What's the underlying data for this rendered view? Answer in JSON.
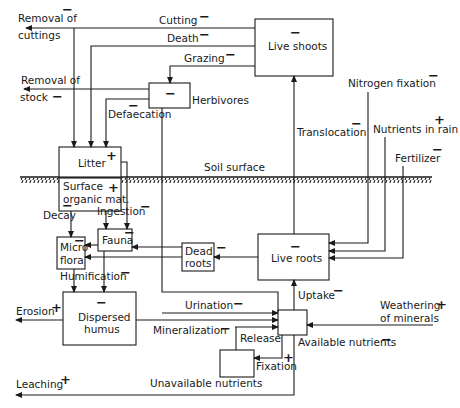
{
  "diagram": {
    "soil_surface_label": "Soil surface",
    "compartments": {
      "live_shoots": {
        "label": "Live shoots",
        "sign": "−"
      },
      "herbivores": {
        "label": "Herbivores",
        "sign": "−"
      },
      "litter": {
        "label": "Litter",
        "sign": "+"
      },
      "surface_organic_mat": {
        "label_line1": "Surface",
        "label_line2": "organic mat.",
        "sign": "+"
      },
      "fauna": {
        "label": "Fauna",
        "sign": "−"
      },
      "micro_flora": {
        "label_line1": "Micro",
        "label_line2": "flora",
        "sign": "−"
      },
      "dead_roots": {
        "label_line1": "Dead",
        "label_line2": "roots",
        "sign": "−"
      },
      "live_roots": {
        "label": "Live roots",
        "sign": "−"
      },
      "dispersed_humus": {
        "label_line1": "Dispersed",
        "label_line2": "humus",
        "sign": "−"
      },
      "available_nutrients": {
        "label": "Available nutrients",
        "sign": "−"
      },
      "unavailable_nutrients": {
        "label": "Unavailable nutrients"
      }
    },
    "flows": {
      "removal_of_cuttings": {
        "line1": "Removal of",
        "line2": "cuttings",
        "sign": "−"
      },
      "cutting": {
        "label": "Cutting",
        "sign": "−"
      },
      "death": {
        "label": "Death",
        "sign": "−"
      },
      "grazing": {
        "label": "Grazing",
        "sign": "−"
      },
      "removal_of_stock": {
        "line1": "Removal of",
        "line2": "stock",
        "sign": "−"
      },
      "defaecation": {
        "label": "Defaecation",
        "sign": "−"
      },
      "nitrogen_fixation": {
        "label": "Nitrogen fixation",
        "sign": "−"
      },
      "nutrients_in_rain": {
        "label": "Nutrients in rain",
        "sign": "+"
      },
      "fertilizer": {
        "label": "Fertilizer",
        "sign": "−"
      },
      "translocation": {
        "label": "Translocation",
        "sign": "−"
      },
      "decay": {
        "label": "Decay",
        "sign": "−"
      },
      "ingestion": {
        "label": "Ingestion",
        "sign": "−"
      },
      "humification": {
        "label": "Humification",
        "sign": "−"
      },
      "erosion": {
        "label": "Erosion",
        "sign": "+"
      },
      "urination": {
        "label": "Urination",
        "sign": "−"
      },
      "mineralization": {
        "label": "Mineralization",
        "sign": "−"
      },
      "uptake": {
        "label": "Uptake",
        "sign": "−"
      },
      "weathering": {
        "line1": "Weathering",
        "line2": "of minerals",
        "sign": "+"
      },
      "release": {
        "label": "Release"
      },
      "fixation": {
        "label": "Fixation",
        "sign": "+"
      },
      "leaching": {
        "label": "Leaching",
        "sign": "+"
      }
    }
  }
}
